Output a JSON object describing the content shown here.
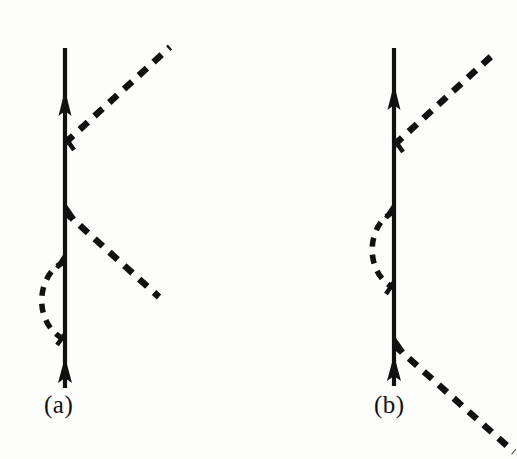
{
  "figure": {
    "kind": "feynman-diagram-pair",
    "background_color": "#fdfdfc",
    "ink_color": "#111111",
    "width": 517,
    "height": 459,
    "panels": [
      {
        "id": "a",
        "caption": "(a)",
        "caption_x": 44,
        "caption_y": 391,
        "fermion_line": {
          "x": 65,
          "y_top": 48,
          "y_bottom": 388,
          "stroke_width": 4.2,
          "arrows": [
            {
              "name": "upper-arrow",
              "y": 108,
              "direction": "up"
            },
            {
              "name": "lower-arrow",
              "y": 378,
              "direction": "up"
            }
          ]
        },
        "vertices": [
          {
            "name": "vertex-emit-upper-boson",
            "x": 65,
            "y": 143
          },
          {
            "name": "vertex-emit-lower-boson",
            "x": 65,
            "y": 212
          },
          {
            "name": "vertex-loop-top",
            "x": 65,
            "y": 262
          },
          {
            "name": "vertex-loop-bottom",
            "x": 65,
            "y": 340
          }
        ],
        "boson_lines": [
          {
            "name": "upper-boson-line",
            "x1": 65,
            "y1": 143,
            "x2": 170,
            "y2": 47
          },
          {
            "name": "lower-boson-line",
            "x1": 65,
            "y1": 212,
            "x2": 159,
            "y2": 297
          }
        ],
        "self_energy_loop": {
          "name": "self-energy-loop-left",
          "x_anchor": 65,
          "y_top": 262,
          "y_bottom": 340,
          "bulge_x": 28,
          "side": "left"
        }
      },
      {
        "id": "b",
        "caption": "(b)",
        "caption_x": 374,
        "caption_y": 391,
        "fermion_line": {
          "x": 394,
          "y_top": 48,
          "y_bottom": 386,
          "stroke_width": 4.2,
          "arrows": [
            {
              "name": "upper-arrow",
              "y": 100,
              "direction": "up"
            },
            {
              "name": "lower-arrow",
              "y": 376,
              "direction": "up"
            }
          ]
        },
        "vertices": [
          {
            "name": "vertex-emit-upper-boson",
            "x": 394,
            "y": 145
          },
          {
            "name": "vertex-loop-top",
            "x": 394,
            "y": 212
          },
          {
            "name": "vertex-loop-bottom",
            "x": 394,
            "y": 288
          },
          {
            "name": "vertex-emit-lower-boson",
            "x": 394,
            "y": 345
          }
        ],
        "boson_lines": [
          {
            "name": "upper-boson-line",
            "x1": 394,
            "y1": 145,
            "x2": 496,
            "y2": 52
          },
          {
            "name": "lower-boson-line",
            "x1": 394,
            "y1": 345,
            "x2": 514,
            "y2": 452
          }
        ],
        "self_energy_loop": {
          "name": "self-energy-loop-left",
          "x_anchor": 394,
          "y_top": 212,
          "y_bottom": 288,
          "bulge_x": 26,
          "side": "left"
        }
      }
    ],
    "style": {
      "dash_pattern": "11 9",
      "dash_stroke_width": 6.5,
      "loop_dash_pattern": "9 8",
      "loop_stroke_width": 5.5
    }
  }
}
